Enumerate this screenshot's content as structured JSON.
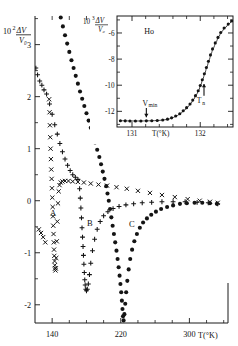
{
  "figure": {
    "background": "#ffffff",
    "ink": "#1a1a1a"
  },
  "main_plot": {
    "ylabel_prefix": "10",
    "ylabel_exp": "2",
    "ylabel_num": "ΔV",
    "ylabel_den": "V₀",
    "xlabel": "T(°K)",
    "y_ticks": [
      "3",
      "2",
      "1",
      "0",
      "-1",
      "-2"
    ],
    "x_ticks": [
      "140",
      "220",
      "300"
    ],
    "curve_labels": [
      "A",
      "B",
      "C"
    ]
  },
  "inset_plot": {
    "ylabel_prefix": "10",
    "ylabel_exp": "3",
    "ylabel_num": "ΔV",
    "ylabel_den": "V₀",
    "xlabel": "T(°K)",
    "sample": "Ho",
    "y_ticks": [
      "-6",
      "-8",
      "-10",
      "-12"
    ],
    "x_ticks": [
      "131",
      "132"
    ],
    "annotations": [
      {
        "name": "v-min",
        "label": "V",
        "sub": "min"
      },
      {
        "name": "t-n",
        "label": "T",
        "sub": "n"
      }
    ]
  },
  "chart_data": [
    {
      "type": "scatter",
      "name": "main",
      "title": "",
      "xlabel": "T(°K)",
      "ylabel": "10^2 ΔV/V₀",
      "xlim": [
        120,
        345
      ],
      "ylim": [
        -2.35,
        3.55
      ],
      "grid": false,
      "legend": "inline-labels",
      "yticks": [
        3,
        2,
        1,
        0,
        -1,
        -2
      ],
      "xticks": [
        140,
        220,
        300
      ],
      "series": [
        {
          "name": "A",
          "marker": "x",
          "label_pos": {
            "x": 141,
            "y": -0.3
          },
          "points": [
            [
              124.5,
              -0.55
            ],
            [
              127.0,
              -0.62
            ],
            [
              129.5,
              -0.7
            ],
            [
              132.0,
              -0.8
            ],
            [
              136.5,
              1.95
            ],
            [
              137.0,
              1.7
            ],
            [
              137.4,
              1.45
            ],
            [
              137.8,
              1.22
            ],
            [
              138.2,
              1.0
            ],
            [
              138.6,
              0.8
            ],
            [
              139.0,
              0.6
            ],
            [
              139.4,
              0.42
            ],
            [
              139.8,
              0.24
            ],
            [
              140.2,
              0.06
            ],
            [
              140.6,
              -0.12
            ],
            [
              141.0,
              -0.3
            ],
            [
              141.3,
              -0.48
            ],
            [
              141.6,
              -0.64
            ],
            [
              141.9,
              -0.8
            ],
            [
              142.2,
              -0.94
            ],
            [
              142.5,
              -1.06
            ],
            [
              142.8,
              -1.16
            ],
            [
              143.1,
              -1.24
            ],
            [
              143.4,
              -1.3
            ],
            [
              143.8,
              -1.34
            ],
            [
              144.2,
              -1.3
            ],
            [
              144.8,
              -1.1
            ],
            [
              145.4,
              -0.78
            ],
            [
              146.0,
              -0.4
            ],
            [
              146.8,
              -0.05
            ],
            [
              147.6,
              0.18
            ],
            [
              148.6,
              0.3
            ],
            [
              150.0,
              0.35
            ],
            [
              152.0,
              0.37
            ],
            [
              155.0,
              0.38
            ],
            [
              159.0,
              0.38
            ],
            [
              164.0,
              0.37
            ],
            [
              170.0,
              0.36
            ],
            [
              177.0,
              0.35
            ],
            [
              185.0,
              0.33
            ],
            [
              194.0,
              0.31
            ],
            [
              204.0,
              0.29
            ],
            [
              215.0,
              0.26
            ],
            [
              227.0,
              0.23
            ],
            [
              240.0,
              0.19
            ],
            [
              254.0,
              0.15
            ],
            [
              268.0,
              0.11
            ],
            [
              283.0,
              0.07
            ],
            [
              298.0,
              0.03
            ],
            [
              312.0,
              0.0
            ],
            [
              324.0,
              -0.02
            ],
            [
              333.0,
              -0.04
            ]
          ]
        },
        {
          "name": "B",
          "marker": "+",
          "label_pos": {
            "x": 184,
            "y": -0.48
          },
          "points": [
            [
              121.0,
              2.55
            ],
            [
              123.0,
              2.42
            ],
            [
              125.5,
              2.3
            ],
            [
              128.0,
              2.22
            ],
            [
              130.5,
              2.13
            ],
            [
              133.5,
              2.05
            ],
            [
              137.0,
              1.86
            ],
            [
              140.0,
              1.66
            ],
            [
              143.0,
              1.46
            ],
            [
              146.0,
              1.28
            ],
            [
              149.0,
              1.1
            ],
            [
              152.0,
              0.94
            ],
            [
              155.0,
              0.8
            ],
            [
              158.0,
              0.68
            ],
            [
              161.0,
              0.58
            ],
            [
              164.0,
              0.5
            ],
            [
              167.0,
              0.45
            ],
            [
              170.0,
              0.41
            ],
            [
              172.0,
              0.23
            ],
            [
              172.8,
              0.05
            ],
            [
              173.5,
              -0.14
            ],
            [
              174.2,
              -0.33
            ],
            [
              174.8,
              -0.52
            ],
            [
              175.4,
              -0.7
            ],
            [
              176.0,
              -0.88
            ],
            [
              176.5,
              -1.05
            ],
            [
              177.0,
              -1.22
            ],
            [
              177.5,
              -1.38
            ],
            [
              178.0,
              -1.52
            ],
            [
              178.5,
              -1.62
            ],
            [
              179.2,
              -1.7
            ],
            [
              180.0,
              -1.73
            ],
            [
              181.0,
              -1.7
            ],
            [
              182.2,
              -1.6
            ],
            [
              183.5,
              -1.42
            ],
            [
              185.0,
              -1.2
            ],
            [
              187.0,
              -0.96
            ],
            [
              189.5,
              -0.74
            ],
            [
              192.5,
              -0.55
            ],
            [
              196.0,
              -0.4
            ],
            [
              200.0,
              -0.29
            ],
            [
              205.0,
              -0.21
            ],
            [
              211.0,
              -0.15
            ],
            [
              218.0,
              -0.11
            ],
            [
              226.0,
              -0.08
            ],
            [
              235.0,
              -0.06
            ],
            [
              245.0,
              -0.04
            ],
            [
              256.0,
              -0.03
            ],
            [
              268.0,
              -0.02
            ],
            [
              281.0,
              -0.02
            ],
            [
              295.0,
              -0.02
            ],
            [
              309.0,
              -0.03
            ],
            [
              322.0,
              -0.04
            ],
            [
              333.0,
              -0.06
            ]
          ]
        },
        {
          "name": "C",
          "marker": "o",
          "label_pos": {
            "x": 233,
            "y": -0.5
          },
          "points": [
            [
              150.0,
              3.52
            ],
            [
              152.5,
              3.35
            ],
            [
              155.0,
              3.18
            ],
            [
              157.5,
              3.02
            ],
            [
              160.0,
              2.86
            ],
            [
              162.5,
              2.7
            ],
            [
              165.0,
              2.55
            ],
            [
              167.5,
              2.4
            ],
            [
              170.0,
              2.25
            ],
            [
              172.5,
              2.1
            ],
            [
              175.0,
              1.96
            ],
            [
              177.5,
              1.82
            ],
            [
              180.0,
              1.68
            ],
            [
              182.5,
              1.54
            ],
            [
              185.0,
              1.4
            ],
            [
              187.5,
              1.26
            ],
            [
              190.0,
              1.12
            ],
            [
              192.5,
              0.98
            ],
            [
              195.0,
              0.84
            ],
            [
              197.0,
              0.7
            ],
            [
              199.0,
              0.56
            ],
            [
              201.0,
              0.42
            ],
            [
              203.0,
              0.28
            ],
            [
              204.5,
              0.14
            ],
            [
              206.0,
              0.0
            ],
            [
              207.5,
              -0.16
            ],
            [
              209.0,
              -0.32
            ],
            [
              210.5,
              -0.48
            ],
            [
              212.0,
              -0.64
            ],
            [
              213.5,
              -0.8
            ],
            [
              215.0,
              -0.96
            ],
            [
              216.3,
              -1.12
            ],
            [
              217.5,
              -1.28
            ],
            [
              218.6,
              -1.44
            ],
            [
              219.6,
              -1.6
            ],
            [
              220.5,
              -1.76
            ],
            [
              221.3,
              -1.92
            ],
            [
              222.0,
              -2.08
            ],
            [
              222.6,
              -2.22
            ],
            [
              223.3,
              -2.3
            ],
            [
              224.2,
              -2.18
            ],
            [
              225.2,
              -1.98
            ],
            [
              226.3,
              -1.76
            ],
            [
              227.6,
              -1.54
            ],
            [
              229.2,
              -1.32
            ],
            [
              231.0,
              -1.12
            ],
            [
              233.2,
              -0.94
            ],
            [
              235.8,
              -0.78
            ],
            [
              238.8,
              -0.64
            ],
            [
              242.2,
              -0.52
            ],
            [
              246.0,
              -0.42
            ],
            [
              250.5,
              -0.34
            ],
            [
              255.5,
              -0.27
            ],
            [
              261.0,
              -0.21
            ],
            [
              267.0,
              -0.16
            ],
            [
              274.0,
              -0.12
            ],
            [
              281.0,
              -0.09
            ],
            [
              289.0,
              -0.06
            ],
            [
              297.0,
              -0.05
            ],
            [
              306.0,
              -0.04
            ],
            [
              315.0,
              -0.04
            ],
            [
              324.0,
              -0.05
            ],
            [
              332.0,
              -0.06
            ]
          ]
        }
      ]
    },
    {
      "type": "scatter",
      "name": "inset",
      "title": "Ho",
      "xlabel": "T(°K)",
      "ylabel": "10^3 ΔV/V₀",
      "xlim": [
        130.78,
        132.48
      ],
      "ylim": [
        -13.2,
        -4.7
      ],
      "grid": false,
      "legend": "none",
      "yticks": [
        -6,
        -8,
        -10,
        -12
      ],
      "xticks": [
        131,
        132
      ],
      "fit_line": true,
      "annotations": [
        {
          "name": "v-min",
          "text": "Vmin",
          "x": 131.17,
          "y": -12.75,
          "arrow_to_y": -12.65
        },
        {
          "name": "t-n",
          "text": "Tn",
          "x": 132.06,
          "y": -10.3,
          "arrow_to_y": -9.6
        }
      ],
      "series": [
        {
          "name": "Ho ultrasonic velocity",
          "marker": "o",
          "points": [
            [
              130.83,
              -12.72
            ],
            [
              130.9,
              -12.73
            ],
            [
              130.97,
              -12.74
            ],
            [
              131.05,
              -12.74
            ],
            [
              131.13,
              -12.74
            ],
            [
              131.21,
              -12.73
            ],
            [
              131.29,
              -12.72
            ],
            [
              131.37,
              -12.7
            ],
            [
              131.45,
              -12.66
            ],
            [
              131.52,
              -12.6
            ],
            [
              131.58,
              -12.5
            ],
            [
              131.64,
              -12.36
            ],
            [
              131.7,
              -12.18
            ],
            [
              131.75,
              -11.96
            ],
            [
              131.8,
              -11.72
            ],
            [
              131.85,
              -11.44
            ],
            [
              131.89,
              -11.14
            ],
            [
              131.93,
              -10.8
            ],
            [
              131.97,
              -10.42
            ],
            [
              132.0,
              -10.02
            ],
            [
              132.03,
              -9.58
            ],
            [
              132.06,
              -9.12
            ],
            [
              132.09,
              -8.64
            ],
            [
              132.12,
              -8.16
            ],
            [
              132.15,
              -7.68
            ],
            [
              132.18,
              -7.22
            ],
            [
              132.22,
              -6.76
            ],
            [
              132.26,
              -6.34
            ],
            [
              132.3,
              -5.96
            ],
            [
              132.35,
              -5.62
            ],
            [
              132.41,
              -5.32
            ],
            [
              132.46,
              -5.08
            ]
          ]
        }
      ]
    }
  ]
}
